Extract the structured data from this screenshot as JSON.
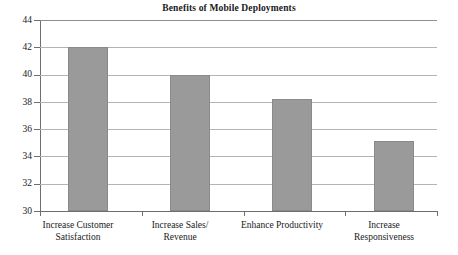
{
  "chart_data": {
    "type": "bar",
    "title": "Benefits of Mobile Deployments",
    "xlabel": "",
    "ylabel": "",
    "categories": [
      "Increase Customer Satisfaction",
      "Increase Sales/ Revenue",
      "Enhance Productivity",
      "Increase Responsiveness"
    ],
    "category_lines": [
      [
        "Increase Customer",
        "Satisfaction"
      ],
      [
        "Increase Sales/",
        "Revenue"
      ],
      [
        "Enhance Productivity",
        ""
      ],
      [
        "Increase",
        "Responsiveness"
      ]
    ],
    "values": [
      42,
      40,
      38.2,
      35.1
    ],
    "ylim": [
      30,
      44
    ],
    "ytick_step": 2,
    "ytick_labels": [
      "44",
      "42",
      "40",
      "38",
      "36",
      "34",
      "32",
      "30"
    ],
    "ytick_values": [
      44,
      42,
      40,
      38,
      36,
      34,
      32,
      30
    ],
    "grid": true,
    "legend": false,
    "legend_position": "none",
    "bar_color": "#9a9a9a",
    "grid_color": "#b4b4b4",
    "axis_color": "#6e6e6e",
    "text_color": "#1a1a1a",
    "background": "#ffffff"
  }
}
